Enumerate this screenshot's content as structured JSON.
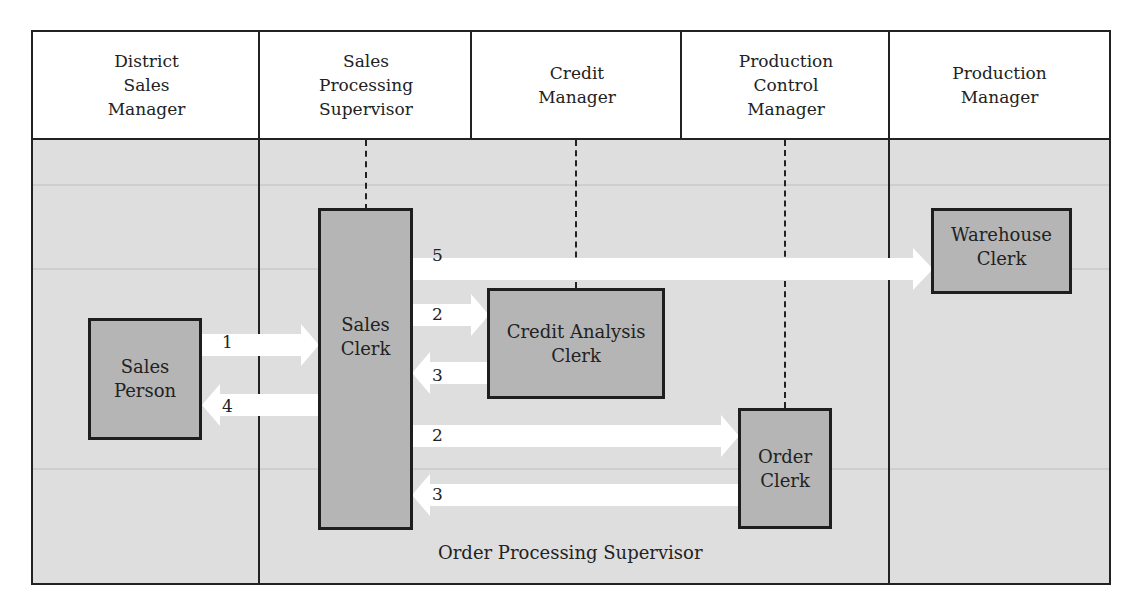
{
  "diagram": {
    "type": "organizational-flow",
    "columns": [
      {
        "label": "District\nSales\nManager"
      },
      {
        "label": "Sales\nProcessing\nSupervisor"
      },
      {
        "label": "Credit\nManager"
      },
      {
        "label": "Production\nControl\nManager"
      },
      {
        "label": "Production\nManager"
      }
    ],
    "boxes": {
      "sales_person": "Sales\nPerson",
      "sales_clerk": "Sales\nClerk",
      "credit_analysis_clerk": "Credit Analysis\nClerk",
      "order_clerk": "Order\nClerk",
      "warehouse_clerk": "Warehouse\nClerk"
    },
    "flows": [
      {
        "step": "1",
        "from": "Sales Person",
        "to": "Sales Clerk"
      },
      {
        "step": "4",
        "from": "Sales Clerk",
        "to": "Sales Person"
      },
      {
        "step": "5",
        "from": "Sales Clerk",
        "to": "Warehouse Clerk"
      },
      {
        "step": "2",
        "from": "Sales Clerk",
        "to": "Credit Analysis Clerk"
      },
      {
        "step": "3",
        "from": "Credit Analysis Clerk",
        "to": "Sales Clerk"
      },
      {
        "step": "2",
        "from": "Sales Clerk",
        "to": "Order Clerk"
      },
      {
        "step": "3",
        "from": "Order Clerk",
        "to": "Sales Clerk"
      }
    ],
    "region_label": "Order Processing Supervisor",
    "colors": {
      "line": "#222222",
      "body_background": "#dedede",
      "box_fill": "#b5b5b5",
      "arrow_fill": "#ffffff"
    }
  }
}
